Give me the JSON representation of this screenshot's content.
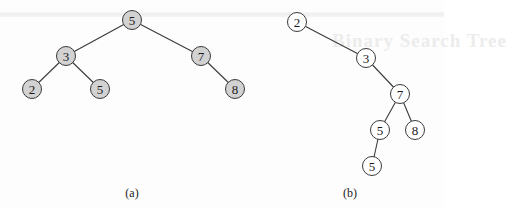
{
  "figure": {
    "ghost_text": "Binary Search Tree",
    "trees": [
      {
        "id": "a",
        "caption": "(a)",
        "caption_pos": [
          132,
          186
        ],
        "style": "filled",
        "nodes": [
          {
            "id": "a0",
            "label": "5",
            "x": 132,
            "y": 20
          },
          {
            "id": "a1",
            "label": "3",
            "x": 66,
            "y": 56
          },
          {
            "id": "a2",
            "label": "7",
            "x": 201,
            "y": 56
          },
          {
            "id": "a3",
            "label": "2",
            "x": 32,
            "y": 89
          },
          {
            "id": "a4",
            "label": "5",
            "x": 100,
            "y": 89
          },
          {
            "id": "a5",
            "label": "8",
            "x": 235,
            "y": 89
          }
        ],
        "edges": [
          [
            "a0",
            "a1"
          ],
          [
            "a0",
            "a2"
          ],
          [
            "a1",
            "a3"
          ],
          [
            "a1",
            "a4"
          ],
          [
            "a2",
            "a5"
          ]
        ]
      },
      {
        "id": "b",
        "caption": "(b)",
        "caption_pos": [
          350,
          186
        ],
        "style": "hollow",
        "nodes": [
          {
            "id": "b0",
            "label": "2",
            "x": 297,
            "y": 22
          },
          {
            "id": "b1",
            "label": "3",
            "x": 366,
            "y": 58
          },
          {
            "id": "b2",
            "label": "7",
            "x": 400,
            "y": 94
          },
          {
            "id": "b3",
            "label": "5",
            "x": 380,
            "y": 130
          },
          {
            "id": "b4",
            "label": "8",
            "x": 415,
            "y": 130
          },
          {
            "id": "b5",
            "label": "5",
            "x": 372,
            "y": 166
          }
        ],
        "edges": [
          [
            "b0",
            "b1"
          ],
          [
            "b1",
            "b2"
          ],
          [
            "b2",
            "b3"
          ],
          [
            "b2",
            "b4"
          ],
          [
            "b3",
            "b5"
          ]
        ]
      }
    ]
  }
}
